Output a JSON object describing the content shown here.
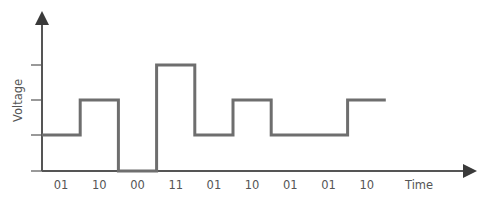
{
  "chart_data": {
    "type": "line",
    "subtype": "step",
    "title": "",
    "xlabel": "Time",
    "ylabel": "Voltage",
    "categories": [
      "01",
      "10",
      "00",
      "11",
      "01",
      "10",
      "01",
      "01",
      "10"
    ],
    "series": [
      {
        "name": "Signal level",
        "values": [
          1,
          2,
          0,
          3,
          1,
          2,
          1,
          1,
          2
        ]
      }
    ],
    "y_levels": [
      0,
      1,
      2,
      3
    ],
    "ylim": [
      0,
      3
    ],
    "grid": false,
    "legend": "none",
    "colors": {
      "signal": "#6e6e6e",
      "axis": "#555555",
      "arrowhead": "#3a3a3a",
      "text": "#555555"
    }
  },
  "labels": {
    "x_axis": "Time",
    "y_axis": "Voltage"
  }
}
